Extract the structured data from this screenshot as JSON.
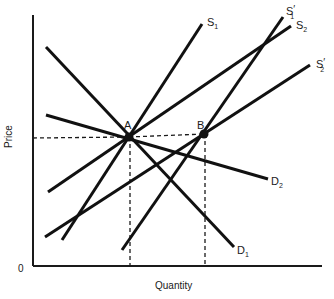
{
  "diagram": {
    "type": "supply-demand",
    "axes": {
      "x_label": "Quantity",
      "y_label": "Price",
      "origin_label": "0"
    },
    "curves": [
      {
        "id": "D1",
        "label": "D",
        "sub": "1",
        "prime": false,
        "x1": 46,
        "y1": 47,
        "x2": 234,
        "y2": 247
      },
      {
        "id": "D2",
        "label": "D",
        "sub": "2",
        "prime": false,
        "x1": 46,
        "y1": 115,
        "x2": 268,
        "y2": 179
      },
      {
        "id": "S1",
        "label": "S",
        "sub": "1",
        "prime": false,
        "x1": 62,
        "y1": 240,
        "x2": 202,
        "y2": 24
      },
      {
        "id": "S1p",
        "label": "S",
        "sub": "1",
        "prime": true,
        "x1": 122,
        "y1": 250,
        "x2": 283,
        "y2": 17
      },
      {
        "id": "S2",
        "label": "S",
        "sub": "2",
        "prime": false,
        "x1": 48,
        "y1": 192,
        "x2": 291,
        "y2": 26
      },
      {
        "id": "S2p",
        "label": "S",
        "sub": "2",
        "prime": true,
        "x1": 45,
        "y1": 237,
        "x2": 310,
        "y2": 65
      }
    ],
    "points": [
      {
        "id": "A",
        "label": "A",
        "x": 129,
        "y": 137
      },
      {
        "id": "B",
        "label": "B",
        "x": 204,
        "y": 134
      }
    ],
    "labels": {
      "S1": "S",
      "S1_sub": "1",
      "S1p": "S",
      "S1p_sub": "1",
      "S2": "S",
      "S2_sub": "2",
      "S2p": "S",
      "S2p_sub": "2",
      "D1": "D",
      "D1_sub": "1",
      "D2": "D",
      "D2_sub": "2",
      "prime": "′",
      "A": "A",
      "B": "B"
    }
  }
}
